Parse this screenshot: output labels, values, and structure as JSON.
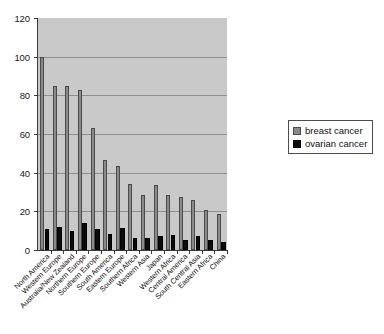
{
  "chart_data": {
    "type": "bar",
    "title": "",
    "subtitle": "",
    "xlabel": "",
    "ylabel": "",
    "ylim": [
      0,
      120
    ],
    "ytick_labels": [
      "120",
      "100",
      "80",
      "60",
      "40",
      "20",
      "0"
    ],
    "ytick_values": [
      120,
      100,
      80,
      60,
      40,
      20,
      0
    ],
    "grid": true,
    "legend_position": "right",
    "categories": [
      "North America",
      "Western Europe",
      "Australia/New Zealand",
      "Northern Europe",
      "Southern Europe",
      "South America",
      "Eastern Europe",
      "Southern Africa",
      "Western Asia",
      "Japan",
      "Western Africa",
      "Central America",
      "South Central Asia",
      "Eastern Africa",
      "China"
    ],
    "series": [
      {
        "name": "breast cancer",
        "color": "#8a8a8a",
        "values": [
          100,
          85,
          85,
          83,
          63,
          46.5,
          43.5,
          34,
          28.5,
          33.5,
          28.5,
          27.5,
          26,
          20.5,
          18.5
        ]
      },
      {
        "name": "ovarian cancer",
        "color": "#0b0b0b",
        "values": [
          11,
          12,
          10,
          14,
          11,
          8.5,
          11.5,
          6,
          6,
          7.5,
          8,
          5,
          7,
          5,
          4
        ]
      }
    ]
  },
  "legend": {
    "items": [
      {
        "label": "breast cancer",
        "color": "#8a8a8a"
      },
      {
        "label": "ovarian cancer",
        "color": "#0b0b0b"
      }
    ]
  }
}
